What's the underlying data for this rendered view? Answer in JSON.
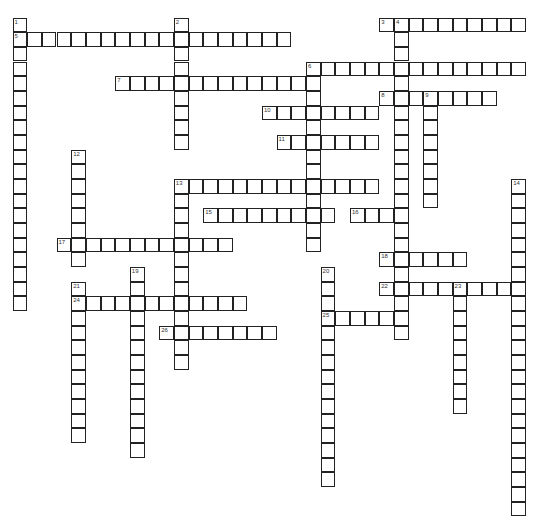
{
  "puzzle": {
    "cell_size": 14.67,
    "origin": {
      "x": 13,
      "y": 18
    },
    "line_color": "#222222",
    "background": "#ffffff",
    "words": [
      {
        "number": "1",
        "direction": "down",
        "col": 0,
        "row": 0,
        "length": 20
      },
      {
        "number": "2",
        "direction": "down",
        "col": 11,
        "row": 0,
        "length": 9
      },
      {
        "number": "3",
        "direction": "across",
        "col": 25,
        "row": 0,
        "length": 10
      },
      {
        "number": "4",
        "direction": "down",
        "col": 26,
        "row": 0,
        "length": 22
      },
      {
        "number": "5",
        "direction": "across",
        "col": 0,
        "row": 1,
        "length": 19
      },
      {
        "number": "6",
        "direction": "across",
        "col": 20,
        "row": 3,
        "length": 15
      },
      {
        "number": "6",
        "direction": "down",
        "col": 20,
        "row": 3,
        "length": 13
      },
      {
        "number": "7",
        "direction": "across",
        "col": 7,
        "row": 4,
        "length": 14
      },
      {
        "number": "8",
        "direction": "across",
        "col": 25,
        "row": 5,
        "length": 8
      },
      {
        "number": "9",
        "direction": "down",
        "col": 28,
        "row": 5,
        "length": 8
      },
      {
        "number": "10",
        "direction": "across",
        "col": 17,
        "row": 6,
        "length": 8
      },
      {
        "number": "11",
        "direction": "across",
        "col": 18,
        "row": 8,
        "length": 7
      },
      {
        "number": "12",
        "direction": "down",
        "col": 4,
        "row": 9,
        "length": 8
      },
      {
        "number": "13",
        "direction": "across",
        "col": 11,
        "row": 11,
        "length": 14
      },
      {
        "number": "13",
        "direction": "down",
        "col": 11,
        "row": 11,
        "length": 13
      },
      {
        "number": "14",
        "direction": "down",
        "col": 34,
        "row": 11,
        "length": 23
      },
      {
        "number": "15",
        "direction": "across",
        "col": 13,
        "row": 13,
        "length": 9
      },
      {
        "number": "16",
        "direction": "across",
        "col": 23,
        "row": 13,
        "length": 4
      },
      {
        "number": "17",
        "direction": "across",
        "col": 3,
        "row": 15,
        "length": 12
      },
      {
        "number": "18",
        "direction": "across",
        "col": 25,
        "row": 16,
        "length": 6
      },
      {
        "number": "19",
        "direction": "down",
        "col": 8,
        "row": 17,
        "length": 13
      },
      {
        "number": "20",
        "direction": "down",
        "col": 21,
        "row": 17,
        "length": 15
      },
      {
        "number": "21",
        "direction": "down",
        "col": 4,
        "row": 18,
        "length": 11
      },
      {
        "number": "22",
        "direction": "across",
        "col": 25,
        "row": 18,
        "length": 10
      },
      {
        "number": "23",
        "direction": "down",
        "col": 30,
        "row": 18,
        "length": 9
      },
      {
        "number": "24",
        "direction": "across",
        "col": 4,
        "row": 19,
        "length": 12
      },
      {
        "number": "25",
        "direction": "across",
        "col": 21,
        "row": 20,
        "length": 6
      },
      {
        "number": "26",
        "direction": "across",
        "col": 10,
        "row": 21,
        "length": 8
      }
    ]
  }
}
